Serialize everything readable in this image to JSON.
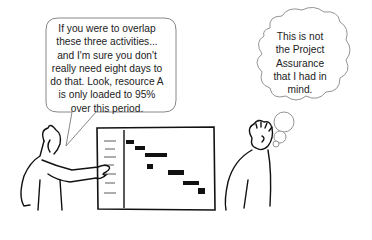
{
  "speech_bubble": {
    "speaker": "presenter",
    "lines": [
      "If you were to overlap",
      "these three activities...",
      "and I'm sure you don't",
      "really need eight days to",
      "do that. Look, resource A",
      "is only loaded to 95%",
      "over this period."
    ]
  },
  "thought_bubble": {
    "thinker": "listener",
    "lines": [
      "This is not",
      "the Project",
      "Assurance",
      "that I had in",
      "mind."
    ]
  },
  "gantt_chart": {
    "task_rows": 7,
    "bar_count": 7
  },
  "colors": {
    "ink": "#111111",
    "bubble_outline": "#888888",
    "text": "#222222",
    "background": "#ffffff"
  }
}
